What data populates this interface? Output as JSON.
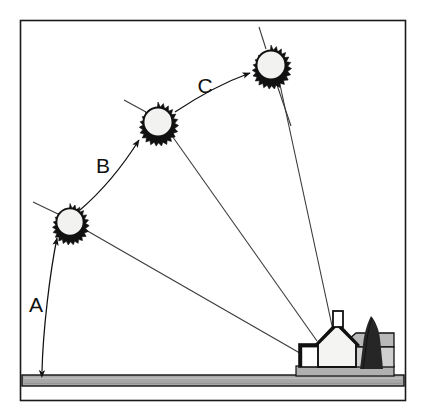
{
  "figure": {
    "type": "line-diagram",
    "width": 425,
    "height": 416
  },
  "colors": {
    "background": "#ffffff",
    "ink": "#111111",
    "frame": "#1a1a1a",
    "ground_fill": "#a8a8a8",
    "ground_stroke": "#111111",
    "sun_fill": "#f2f2f0",
    "sun_stroke": "#111111",
    "house_wall": "#f4f4f2",
    "house_roof": "#b9b9b9",
    "house_wing": "#cfcfcf",
    "tree": "#262626",
    "line": "#3a3a3a"
  },
  "frame": {
    "x": 20,
    "y": 20,
    "width": 386,
    "height": 381
  },
  "ground": {
    "label": "ground-strip",
    "x": 22,
    "y": 375,
    "width": 382,
    "height": 11
  },
  "suns": [
    {
      "id": "sun-a",
      "label": "A",
      "cx": 70,
      "cy": 222,
      "r": 15,
      "spikes": 24
    },
    {
      "id": "sun-b",
      "label": "B",
      "cx": 158,
      "cy": 122,
      "r": 16,
      "spikes": 24
    },
    {
      "id": "sun-c",
      "label": "C",
      "cx": 271,
      "cy": 65,
      "r": 16,
      "spikes": 24
    }
  ],
  "arc_labels": [
    {
      "id": "label-a",
      "text": "A",
      "x": 36,
      "y": 312
    },
    {
      "id": "label-b",
      "text": "B",
      "x": 103,
      "y": 173
    },
    {
      "id": "label-c",
      "text": "C",
      "x": 205,
      "y": 93
    }
  ],
  "motion_arcs": [
    {
      "id": "arc-a",
      "label": "A",
      "from": "ground",
      "to": "sun-a",
      "path": "M 42,373 C 43,330 50,272 58,238",
      "arrow_start": true,
      "arrow_end": true
    },
    {
      "id": "arc-b",
      "label": "B",
      "from": "sun-a",
      "to": "sun-b",
      "path": "M 82,209 C 104,190 126,163 141,138",
      "arrow_start": false,
      "arrow_end": true
    },
    {
      "id": "arc-c",
      "label": "C",
      "from": "sun-b",
      "to": "sun-c",
      "path": "M 176,112 C 200,96 226,82 252,73",
      "arrow_start": false,
      "arrow_end": true
    }
  ],
  "sight_lines": [
    {
      "id": "sightline-a",
      "from": "sun-a",
      "x1": 84,
      "y1": 229,
      "x2": 305,
      "y2": 356
    },
    {
      "id": "sightline-b",
      "from": "sun-b",
      "x1": 170,
      "y1": 133,
      "x2": 317,
      "y2": 341
    },
    {
      "id": "sightline-c",
      "from": "sun-c",
      "x1": 279,
      "y1": 80,
      "x2": 334,
      "y2": 335
    }
  ],
  "sun_rays": [
    {
      "id": "ray-a-upleft",
      "x1": 33,
      "y1": 203,
      "x2": 57,
      "y2": 214
    },
    {
      "id": "ray-b-upleft",
      "x1": 124,
      "y1": 101,
      "x2": 146,
      "y2": 113
    },
    {
      "id": "ray-c-up",
      "x1": 260,
      "y1": 28,
      "x2": 266,
      "y2": 49
    },
    {
      "id": "ray-c-down",
      "x1": 277,
      "y1": 82,
      "x2": 290,
      "y2": 124
    }
  ],
  "house": {
    "id": "house",
    "description": "gabled house with chimney, carport on left and side wing on right",
    "parts": [
      {
        "id": "carport-roof",
        "name": "carport-roof"
      },
      {
        "id": "carport-post",
        "name": "carport-post"
      },
      {
        "id": "main-gable",
        "name": "main-gable-wall"
      },
      {
        "id": "chimney",
        "name": "chimney"
      },
      {
        "id": "side-wing-roof",
        "name": "side-wing-roof"
      },
      {
        "id": "side-wing-wall",
        "name": "side-wing-wall"
      },
      {
        "id": "base-slab",
        "name": "house-base-slab"
      }
    ]
  },
  "tree": {
    "id": "conifer-tree",
    "name": "conifer-tree",
    "x": 365,
    "y": 318
  }
}
